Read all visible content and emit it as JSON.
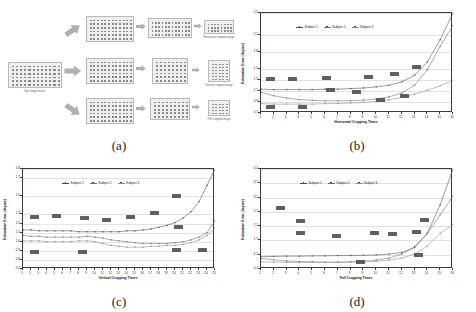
{
  "figure": {
    "panels": [
      {
        "id": "a",
        "label": "(a)"
      },
      {
        "id": "b",
        "label": "(b)"
      },
      {
        "id": "c",
        "label": "(c)"
      },
      {
        "id": "d",
        "label": "(d)"
      }
    ]
  },
  "diagram": {
    "nodes": [
      {
        "name": "source-matrix",
        "label": "Eye-image matrix",
        "cols": 12,
        "rows": 6
      },
      {
        "name": "horizontal-branch-matrix",
        "label": "",
        "cols": 12,
        "rows": 6
      },
      {
        "name": "vertical-branch-matrix",
        "label": "",
        "cols": 12,
        "rows": 6
      },
      {
        "name": "full-branch-matrix",
        "label": "",
        "cols": 12,
        "rows": 6
      },
      {
        "name": "horizontal-stage2-matrix",
        "label": "",
        "cols": 12,
        "rows": 4
      },
      {
        "name": "vertical-stage2-matrix",
        "label": "",
        "cols": 8,
        "rows": 6
      },
      {
        "name": "full-stage2-matrix",
        "label": "",
        "cols": 9,
        "rows": 5
      },
      {
        "name": "horizontal-cropped-image",
        "label": "Horizontal cropped image",
        "cols": 8,
        "rows": 3
      },
      {
        "name": "vertical-cropped-image",
        "label": "Vertical cropped image",
        "cols": 5,
        "rows": 6
      },
      {
        "name": "full-cropped-image",
        "label": "Full cropped image",
        "cols": 5,
        "rows": 4
      }
    ]
  },
  "charts": [
    {
      "id": "b",
      "chart_data": {
        "type": "line",
        "title": "",
        "xlabel": "Horizontal Cropping Times",
        "ylabel": "Estimation Error (degree)",
        "xlim": [
          1,
          16
        ],
        "ylim": [
          0.7,
          2.5
        ],
        "grid": true,
        "legend_position": "top-center",
        "xticks": [
          1,
          2,
          3,
          4,
          5,
          6,
          7,
          8,
          9,
          10,
          11,
          12,
          13,
          14,
          15,
          16
        ],
        "yticks": [
          0.7,
          0.9,
          1.1,
          1.3,
          1.5,
          1.8,
          2.1,
          2.5
        ],
        "x": [
          1,
          2,
          3,
          4,
          5,
          6,
          7,
          8,
          9,
          10,
          11,
          12,
          13,
          14,
          15,
          16
        ],
        "series": [
          {
            "name": "Subject 1",
            "values": [
              1.13,
              1.12,
              1.12,
              1.12,
              1.12,
              1.13,
              1.13,
              1.14,
              1.15,
              1.17,
              1.2,
              1.26,
              1.38,
              1.62,
              2.02,
              2.5
            ]
          },
          {
            "name": "Subject 2",
            "values": [
              1.07,
              1.01,
              0.97,
              0.94,
              0.93,
              0.92,
              0.92,
              0.92,
              0.93,
              0.95,
              0.99,
              1.06,
              1.2,
              1.48,
              1.9,
              2.28
            ]
          },
          {
            "name": "Subject 3",
            "values": [
              0.87,
              0.86,
              0.86,
              0.86,
              0.86,
              0.87,
              0.87,
              0.88,
              0.89,
              0.91,
              0.94,
              0.98,
              1.04,
              1.11,
              1.19,
              1.29
            ]
          }
        ],
        "annotations": [
          "1.13",
          "1.12",
          "1.12",
          "1.15",
          "1.26",
          "1.62",
          "0.87",
          "0.86",
          "1.07",
          "0.93",
          "0.95",
          "1.06"
        ]
      }
    },
    {
      "id": "c",
      "chart_data": {
        "type": "line",
        "title": "",
        "xlabel": "Vertical Cropping Times",
        "ylabel": "Estimation Error (degree)",
        "xlim": [
          1,
          25
        ],
        "ylim": [
          0.7,
          1.8
        ],
        "grid": true,
        "legend_position": "top-center",
        "xticks": [
          1,
          2,
          3,
          4,
          5,
          6,
          7,
          8,
          9,
          10,
          11,
          12,
          13,
          14,
          15,
          16,
          17,
          18,
          19,
          20,
          21,
          22,
          23,
          24,
          25
        ],
        "yticks": [
          0.7,
          0.8,
          0.9,
          1.0,
          1.1,
          1.2,
          1.3,
          1.5,
          1.7,
          1.8
        ],
        "x": [
          1,
          2,
          3,
          4,
          5,
          6,
          7,
          8,
          9,
          10,
          11,
          12,
          13,
          14,
          15,
          16,
          17,
          18,
          19,
          20,
          21,
          22,
          23,
          24,
          25
        ],
        "series": [
          {
            "name": "Subject 1",
            "values": [
              1.13,
              1.13,
              1.12,
              1.12,
              1.12,
              1.12,
              1.12,
              1.11,
              1.11,
              1.11,
              1.11,
              1.11,
              1.11,
              1.12,
              1.12,
              1.13,
              1.14,
              1.16,
              1.18,
              1.21,
              1.26,
              1.33,
              1.44,
              1.62,
              1.8
            ]
          },
          {
            "name": "Subject 2",
            "values": [
              1.07,
              1.06,
              1.06,
              1.05,
              1.05,
              1.05,
              1.05,
              1.05,
              1.06,
              1.05,
              1.04,
              1.02,
              1.01,
              1.0,
              0.99,
              0.98,
              0.98,
              0.98,
              0.98,
              0.99,
              1.0,
              1.02,
              1.05,
              1.1,
              1.23
            ]
          },
          {
            "name": "Subject 3",
            "values": [
              1.01,
              1.01,
              1.01,
              1.0,
              1.0,
              1.0,
              1.0,
              1.01,
              1.01,
              1.0,
              0.98,
              0.96,
              0.95,
              0.94,
              0.94,
              0.94,
              0.95,
              0.95,
              0.96,
              0.96,
              0.97,
              0.99,
              1.02,
              1.07,
              1.15
            ]
          }
        ],
        "annotations": [
          "1.13",
          "1.12",
          "1.12",
          "1.11",
          "1.12",
          "1.18",
          "1.62",
          "1.10",
          "0.78",
          "0.78",
          "0.98",
          "0.94"
        ]
      }
    },
    {
      "id": "d",
      "chart_data": {
        "type": "line",
        "title": "",
        "xlabel": "Full Cropping Times",
        "ylabel": "Estimation Error (degree)",
        "xlim": [
          1,
          16
        ],
        "ylim": [
          0.7,
          4.2
        ],
        "grid": true,
        "legend_position": "top-center",
        "xticks": [
          1,
          2,
          3,
          4,
          5,
          6,
          7,
          8,
          9,
          10,
          11,
          12,
          13,
          14,
          15,
          16
        ],
        "yticks": [
          0.7,
          1.2,
          1.7,
          2.2,
          2.7,
          3.2,
          3.7,
          4.2
        ],
        "x": [
          1,
          2,
          3,
          4,
          5,
          6,
          7,
          8,
          9,
          10,
          11,
          12,
          13,
          14,
          15,
          16
        ],
        "series": [
          {
            "name": "Subject 1",
            "values": [
              1.13,
              1.14,
              1.15,
              1.15,
              1.16,
              1.16,
              1.17,
              1.17,
              1.18,
              1.19,
              1.22,
              1.28,
              1.45,
              1.95,
              2.95,
              4.3
            ]
          },
          {
            "name": "Subject 2",
            "values": [
              1.07,
              1.02,
              0.98,
              0.96,
              0.95,
              0.94,
              0.94,
              0.95,
              0.97,
              1.01,
              1.08,
              1.22,
              1.48,
              1.95,
              2.6,
              3.25
            ]
          },
          {
            "name": "Subject 3",
            "values": [
              0.95,
              0.94,
              0.93,
              0.93,
              0.93,
              0.93,
              0.93,
              0.94,
              0.95,
              0.97,
              1.01,
              1.08,
              1.22,
              1.5,
              1.95,
              2.25
            ]
          }
        ],
        "annotations": [
          "2.25",
          "1.80",
          "1.65",
          "1.47",
          "1.42",
          "1.42",
          "1.42",
          "1.78",
          "0.72",
          "0.95"
        ]
      }
    }
  ],
  "legend": {
    "entries": [
      "Subject 1",
      "Subject 2",
      "Subject 3"
    ]
  },
  "colors": {
    "series1": "#4a4a4a",
    "series2": "#6e6e6e",
    "series3": "#8c8c8c",
    "axis": "#3c3c3c",
    "grid": "#e2e2e2",
    "matrix_fill": "#efefef",
    "matrix_dot": "#8a8a8a",
    "arrow": "#b0b0b0"
  }
}
